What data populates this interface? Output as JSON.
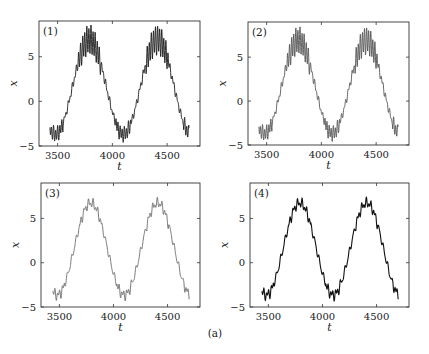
{
  "figure": {
    "caption": "(a)",
    "background": "#ffffff",
    "axis_color": "#333333"
  },
  "panels": [
    {
      "tag": "(1)",
      "xlabel": "t",
      "ylabel": "x",
      "box": {
        "x": 39,
        "y": 21,
        "w": 161,
        "h": 125
      },
      "xlim": [
        3330,
        4800
      ],
      "ylim": [
        -5,
        9
      ],
      "xticks": [
        3500,
        4000,
        4500
      ],
      "yticks": [
        -5,
        0,
        5
      ],
      "line_color": "#1a1a1a",
      "line_width": 0.9
    },
    {
      "tag": "(2)",
      "xlabel": "t",
      "ylabel": "x",
      "box": {
        "x": 248,
        "y": 22,
        "w": 161,
        "h": 123
      },
      "xlim": [
        3330,
        4800
      ],
      "ylim": [
        -5,
        9
      ],
      "xticks": [
        3500,
        4000,
        4500
      ],
      "yticks": [
        -5,
        0,
        5
      ],
      "line_color": "#555555",
      "line_width": 0.9
    },
    {
      "tag": "(3)",
      "xlabel": "t",
      "ylabel": "x",
      "box": {
        "x": 41,
        "y": 183,
        "w": 159,
        "h": 124
      },
      "xlim": [
        3330,
        4800
      ],
      "ylim": [
        -5,
        9
      ],
      "xticks": [
        3500,
        4000,
        4500
      ],
      "yticks": [
        -5,
        0,
        5
      ],
      "line_color": "#6a6a6a",
      "line_width": 0.9
    },
    {
      "tag": "(4)",
      "xlabel": "t",
      "ylabel": "x",
      "box": {
        "x": 250,
        "y": 183,
        "w": 159,
        "h": 124
      },
      "xlim": [
        3330,
        4800
      ],
      "ylim": [
        -5,
        9
      ],
      "xticks": [
        3500,
        4000,
        4500
      ],
      "yticks": [
        -5,
        0,
        5
      ],
      "line_color": "#111111",
      "line_width": 1.1
    }
  ],
  "chart_data": [
    {
      "type": "line",
      "title": "(1)",
      "xlabel": "t",
      "ylabel": "x",
      "xlim": [
        3330,
        4800
      ],
      "ylim": [
        -5,
        9
      ],
      "xticks": [
        3500,
        4000,
        4500
      ],
      "yticks": [
        -5,
        0,
        5
      ],
      "grid": false,
      "series": [
        {
          "name": "x(t) panel 1",
          "t_range": [
            3430,
            4700
          ],
          "model": {
            "mean": 1.6,
            "amplitude": 5.3,
            "period": 620,
            "peak_t": 3790,
            "fast_period": 19,
            "fast_amp_peak": 1.5,
            "fast_amp_trough": 0.7,
            "step_amp": 0.25
          },
          "key_points": [
            [
              3430,
              -3.0
            ],
            [
              3450,
              -4.2
            ],
            [
              3500,
              -3.3
            ],
            [
              3600,
              1.0
            ],
            [
              3700,
              5.5
            ],
            [
              3790,
              8.0
            ],
            [
              3900,
              4.0
            ],
            [
              4000,
              -2.5
            ],
            [
              4080,
              -4.3
            ],
            [
              4100,
              -3.8
            ],
            [
              4200,
              0.0
            ],
            [
              4300,
              5.0
            ],
            [
              4410,
              8.0
            ],
            [
              4500,
              4.0
            ],
            [
              4600,
              -1.0
            ],
            [
              4700,
              -4.4
            ]
          ]
        }
      ]
    },
    {
      "type": "line",
      "title": "(2)",
      "xlabel": "t",
      "ylabel": "x",
      "xlim": [
        3330,
        4800
      ],
      "ylim": [
        -5,
        9
      ],
      "xticks": [
        3500,
        4000,
        4500
      ],
      "yticks": [
        -5,
        0,
        5
      ],
      "grid": false,
      "series": [
        {
          "name": "x(t) panel 2",
          "t_range": [
            3430,
            4700
          ],
          "model": {
            "mean": 1.6,
            "amplitude": 5.3,
            "period": 620,
            "peak_t": 3790,
            "fast_period": 19,
            "fast_amp_peak": 1.4,
            "fast_amp_trough": 0.7,
            "step_amp": 0.25
          },
          "key_points": [
            [
              3430,
              -3.0
            ],
            [
              3450,
              -4.2
            ],
            [
              3500,
              -3.3
            ],
            [
              3600,
              1.0
            ],
            [
              3700,
              5.5
            ],
            [
              3790,
              7.9
            ],
            [
              3900,
              4.0
            ],
            [
              4000,
              -2.5
            ],
            [
              4080,
              -4.3
            ],
            [
              4100,
              -3.8
            ],
            [
              4200,
              0.0
            ],
            [
              4300,
              5.0
            ],
            [
              4410,
              7.9
            ],
            [
              4500,
              4.0
            ],
            [
              4600,
              -1.0
            ],
            [
              4700,
              -4.4
            ]
          ]
        }
      ]
    },
    {
      "type": "line",
      "title": "(3)",
      "xlabel": "t",
      "ylabel": "x",
      "xlim": [
        3330,
        4800
      ],
      "ylim": [
        -5,
        9
      ],
      "xticks": [
        3500,
        4000,
        4500
      ],
      "yticks": [
        -5,
        0,
        5
      ],
      "grid": false,
      "series": [
        {
          "name": "x(t) panel 3",
          "t_range": [
            3440,
            4700
          ],
          "model": {
            "mean": 1.55,
            "amplitude": 5.2,
            "period": 620,
            "peak_t": 3790,
            "fast_period": 22,
            "fast_amp_peak": 0.3,
            "fast_amp_trough": 0.35,
            "step_amp": 0.35
          },
          "key_points": [
            [
              3440,
              -3.6
            ],
            [
              3500,
              -3.5
            ],
            [
              3600,
              0.5
            ],
            [
              3700,
              5.0
            ],
            [
              3790,
              6.8
            ],
            [
              3900,
              4.5
            ],
            [
              4000,
              -1.5
            ],
            [
              4090,
              -3.7
            ],
            [
              4200,
              -0.5
            ],
            [
              4300,
              4.5
            ],
            [
              4410,
              6.8
            ],
            [
              4500,
              4.5
            ],
            [
              4600,
              -0.5
            ],
            [
              4700,
              -3.5
            ]
          ]
        }
      ]
    },
    {
      "type": "line",
      "title": "(4)",
      "xlabel": "t",
      "ylabel": "x",
      "xlim": [
        3330,
        4800
      ],
      "ylim": [
        -5,
        9
      ],
      "xticks": [
        3500,
        4000,
        4500
      ],
      "yticks": [
        -5,
        0,
        5
      ],
      "grid": false,
      "series": [
        {
          "name": "x(t) panel 4",
          "t_range": [
            3440,
            4700
          ],
          "model": {
            "mean": 1.55,
            "amplitude": 5.2,
            "period": 620,
            "peak_t": 3790,
            "fast_period": 22,
            "fast_amp_peak": 0.3,
            "fast_amp_trough": 0.35,
            "step_amp": 0.35
          },
          "key_points": [
            [
              3440,
              -3.6
            ],
            [
              3500,
              -3.5
            ],
            [
              3600,
              0.5
            ],
            [
              3700,
              5.0
            ],
            [
              3790,
              6.8
            ],
            [
              3900,
              4.5
            ],
            [
              4000,
              -1.5
            ],
            [
              4090,
              -3.7
            ],
            [
              4200,
              -0.5
            ],
            [
              4300,
              4.5
            ],
            [
              4410,
              6.8
            ],
            [
              4500,
              4.5
            ],
            [
              4600,
              -0.5
            ],
            [
              4700,
              -3.5
            ]
          ]
        }
      ]
    }
  ]
}
